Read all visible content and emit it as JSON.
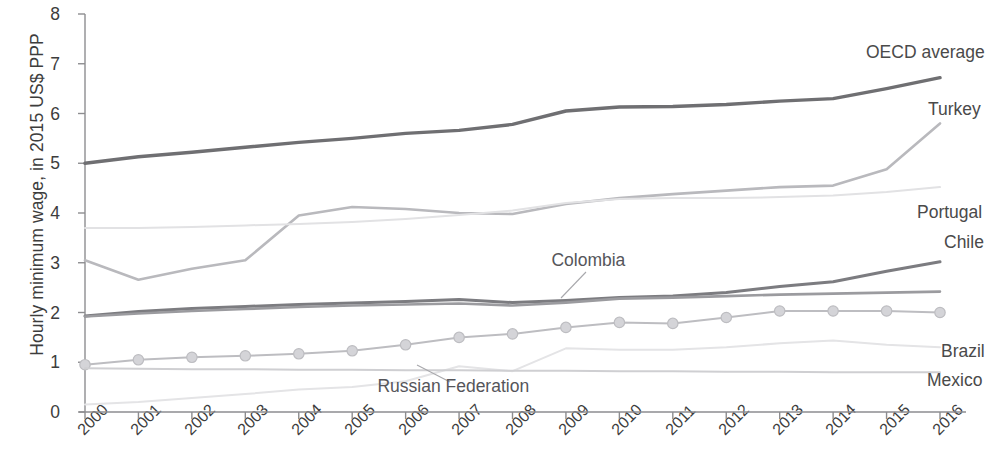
{
  "chart_data": {
    "type": "line",
    "title": "",
    "subtitle": "",
    "xlabel": "",
    "ylabel": "Hourly minimum wage, in 2015 US$ PPP",
    "x": [
      2000,
      2001,
      2002,
      2003,
      2004,
      2005,
      2006,
      2007,
      2008,
      2009,
      2010,
      2011,
      2012,
      2013,
      2014,
      2015,
      2016
    ],
    "xticklabels": [
      "2000",
      "2001",
      "2002",
      "2003",
      "2004",
      "2005",
      "2006",
      "2007",
      "2008",
      "2009",
      "2010",
      "2011",
      "2012",
      "2013",
      "2014",
      "2015",
      "2016"
    ],
    "yticklabels": [
      "0",
      "1",
      "2",
      "3",
      "4",
      "5",
      "6",
      "7",
      "8"
    ],
    "ylim": [
      0,
      8
    ],
    "xlim": [
      2000,
      2016
    ],
    "grid": false,
    "legend_position": "inline-right",
    "series": [
      {
        "name": "OECD average",
        "color": "#6f6f72",
        "width": 3.4,
        "marker": "none",
        "label_position": "right",
        "values": [
          5.0,
          5.13,
          5.22,
          5.32,
          5.42,
          5.5,
          5.6,
          5.66,
          5.78,
          6.05,
          6.13,
          6.14,
          6.18,
          6.25,
          6.3,
          6.5,
          6.72
        ]
      },
      {
        "name": "Turkey",
        "color": "#b9b9bd",
        "width": 2.6,
        "marker": "none",
        "label_position": "right",
        "values": [
          3.05,
          2.66,
          2.88,
          3.05,
          3.95,
          4.12,
          4.08,
          4.0,
          3.98,
          4.18,
          4.3,
          4.38,
          4.45,
          4.52,
          4.55,
          4.88,
          5.8
        ]
      },
      {
        "name": "Portugal",
        "color": "#e2e2e4",
        "width": 2.0,
        "marker": "none",
        "label_position": "right",
        "values": [
          3.7,
          3.7,
          3.72,
          3.75,
          3.78,
          3.82,
          3.88,
          3.96,
          4.05,
          4.2,
          4.28,
          4.3,
          4.3,
          4.32,
          4.35,
          4.42,
          4.52
        ]
      },
      {
        "name": "Chile",
        "color": "#7c7c80",
        "width": 3.0,
        "marker": "none",
        "label_position": "right",
        "values": [
          1.93,
          2.02,
          2.08,
          2.12,
          2.16,
          2.19,
          2.22,
          2.26,
          2.2,
          2.24,
          2.3,
          2.33,
          2.4,
          2.52,
          2.62,
          2.83,
          3.02
        ]
      },
      {
        "name": "Colombia",
        "color": "#9b9b9f",
        "width": 2.6,
        "marker": "none",
        "label_position": "inline",
        "values": [
          1.92,
          1.98,
          2.03,
          2.07,
          2.11,
          2.14,
          2.16,
          2.18,
          2.14,
          2.2,
          2.28,
          2.3,
          2.33,
          2.36,
          2.38,
          2.4,
          2.42
        ]
      },
      {
        "name": "Brazil",
        "color": "#bdbdc1",
        "width": 2.0,
        "marker": "circle",
        "label_position": "right",
        "values": [
          0.95,
          1.05,
          1.1,
          1.13,
          1.17,
          1.23,
          1.35,
          1.5,
          1.57,
          1.7,
          1.8,
          1.78,
          1.9,
          2.03,
          2.03,
          2.03,
          2.0
        ]
      },
      {
        "name": "Russian Federation",
        "color": "#e4e4e6",
        "width": 2.0,
        "marker": "none",
        "label_position": "inline",
        "values": [
          0.15,
          0.2,
          0.28,
          0.36,
          0.45,
          0.5,
          0.62,
          0.92,
          0.82,
          1.28,
          1.25,
          1.25,
          1.3,
          1.38,
          1.44,
          1.35,
          1.3
        ]
      },
      {
        "name": "Mexico",
        "color": "#cfcfd2",
        "width": 2.0,
        "marker": "none",
        "label_position": "right",
        "values": [
          0.88,
          0.87,
          0.86,
          0.86,
          0.85,
          0.85,
          0.84,
          0.84,
          0.83,
          0.83,
          0.82,
          0.82,
          0.81,
          0.81,
          0.8,
          0.8,
          0.8
        ]
      }
    ],
    "annotations": [
      {
        "text": "Colombia",
        "x": 585,
        "y": 250,
        "leader_from": [
          586,
          272
        ],
        "leader_to": [
          561,
          298
        ]
      },
      {
        "text": "Russian Federation",
        "x": 453,
        "y": 376,
        "leader_from": [
          450,
          382
        ],
        "leader_to": [
          417,
          365
        ]
      }
    ],
    "right_labels": [
      {
        "text": "OECD average",
        "x": 866,
        "y": 42
      },
      {
        "text": "Turkey",
        "x": 928,
        "y": 99
      },
      {
        "text": "Portugal",
        "x": 917,
        "y": 202
      },
      {
        "text": "Chile",
        "x": 944,
        "y": 232
      },
      {
        "text": "Brazil",
        "x": 941,
        "y": 341
      },
      {
        "text": "Mexico",
        "x": 927,
        "y": 370
      }
    ]
  },
  "axis": {
    "y_label_text": "Hourly minimum wage, in 2015 US$ PPP",
    "y_ticks": [
      "8",
      "7",
      "6",
      "5",
      "4",
      "3",
      "2",
      "1",
      "0"
    ],
    "x_ticks": [
      "2000",
      "2001",
      "2002",
      "2003",
      "2004",
      "2005",
      "2006",
      "2007",
      "2008",
      "2009",
      "2010",
      "2011",
      "2012",
      "2013",
      "2014",
      "2015",
      "2016"
    ],
    "axis_color": "#8d8d90"
  }
}
